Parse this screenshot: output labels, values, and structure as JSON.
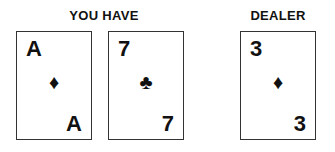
{
  "player": {
    "label": "YOU HAVE",
    "cards": [
      {
        "rank": "A",
        "suit": "♦",
        "suit_name": "diamonds"
      },
      {
        "rank": "7",
        "suit": "♣",
        "suit_name": "clubs"
      }
    ]
  },
  "dealer": {
    "label": "DEALER",
    "cards": [
      {
        "rank": "3",
        "suit": "♦",
        "suit_name": "diamonds"
      }
    ]
  }
}
